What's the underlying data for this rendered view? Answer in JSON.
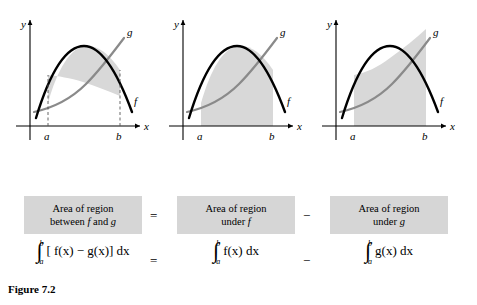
{
  "figure": {
    "label": "Figure 7.2",
    "panels": [
      {
        "name": "region-between-f-and-g",
        "axis_x_label": "x",
        "axis_y_label": "y",
        "curve_f_label": "f",
        "curve_g_label": "g",
        "tick_a_label": "a",
        "tick_b_label": "b",
        "shading": "between f and g, from a to b"
      },
      {
        "name": "region-under-f",
        "axis_x_label": "x",
        "axis_y_label": "y",
        "curve_f_label": "f",
        "curve_g_label": "g",
        "tick_a_label": "a",
        "tick_b_label": "b",
        "shading": "under f, from a to b"
      },
      {
        "name": "region-under-g",
        "axis_x_label": "x",
        "axis_y_label": "y",
        "curve_f_label": "f",
        "curve_g_label": "g",
        "tick_a_label": "a",
        "tick_b_label": "b",
        "shading": "under g, from a to b"
      }
    ],
    "captions": [
      {
        "line1": "Area of region",
        "line2": "between f and g"
      },
      {
        "line1": "Area of region",
        "line2": "under f"
      },
      {
        "line1": "Area of region",
        "line2": "under g"
      }
    ],
    "operators": {
      "equals": "=",
      "minus": "−"
    },
    "integrals": [
      {
        "lower": "a",
        "upper": "b",
        "body": "[ f(x) − g(x)] dx"
      },
      {
        "lower": "a",
        "upper": "b",
        "body": "f(x) dx"
      },
      {
        "lower": "a",
        "upper": "b",
        "body": "g(x) dx"
      }
    ],
    "colors": {
      "shade": "#d8d8d8",
      "caption_box": "#d6d6d6",
      "curve_f": "#000000",
      "curve_g": "#8a8a8a",
      "axis": "#000000"
    }
  }
}
